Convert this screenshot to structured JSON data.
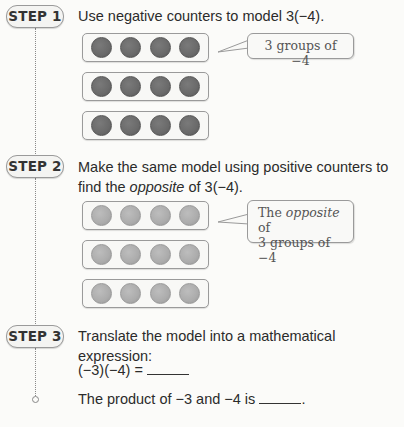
{
  "steps": [
    {
      "badge": "STEP 1",
      "instruction": "Use negative counters to model 3(−4).",
      "counter_type": "negative",
      "counter_color": "#6a6a6a",
      "groups": [
        4,
        4,
        4
      ],
      "callout": {
        "line1_plain": "3 groups of −4"
      }
    },
    {
      "badge": "STEP 2",
      "instruction_line1": "Make the same model using positive counters to",
      "instruction_line2_pre": "find the ",
      "instruction_line2_italic": "opposite",
      "instruction_line2_post": " of 3(−4).",
      "counter_type": "positive",
      "counter_color": "#acacac",
      "groups": [
        4,
        4,
        4
      ],
      "callout": {
        "line1_pre": "The ",
        "line1_italic": "opposite",
        "line1_post": " of",
        "line2": "3 groups of −4"
      }
    },
    {
      "badge": "STEP 3",
      "instruction": "Translate the model into a mathematical expression:",
      "equation": "(−3)(−4) =",
      "product_pre": "The product of −3 and −4 is",
      "product_post": "."
    }
  ]
}
